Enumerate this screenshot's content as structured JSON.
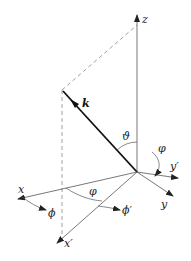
{
  "diagram": {
    "labels": {
      "z": "z",
      "k": "k",
      "theta": "ϑ",
      "varphi_top": "φ",
      "y_prime": "y′",
      "y": "y",
      "x": "x",
      "x_prime": "x′",
      "varphi_bottom": "φ",
      "phi": "ϕ",
      "phi_prime": "ϕ′"
    },
    "colors": {
      "axis": "#555555",
      "vector": "#111111",
      "dashed": "#888888",
      "background": "#ffffff"
    }
  }
}
